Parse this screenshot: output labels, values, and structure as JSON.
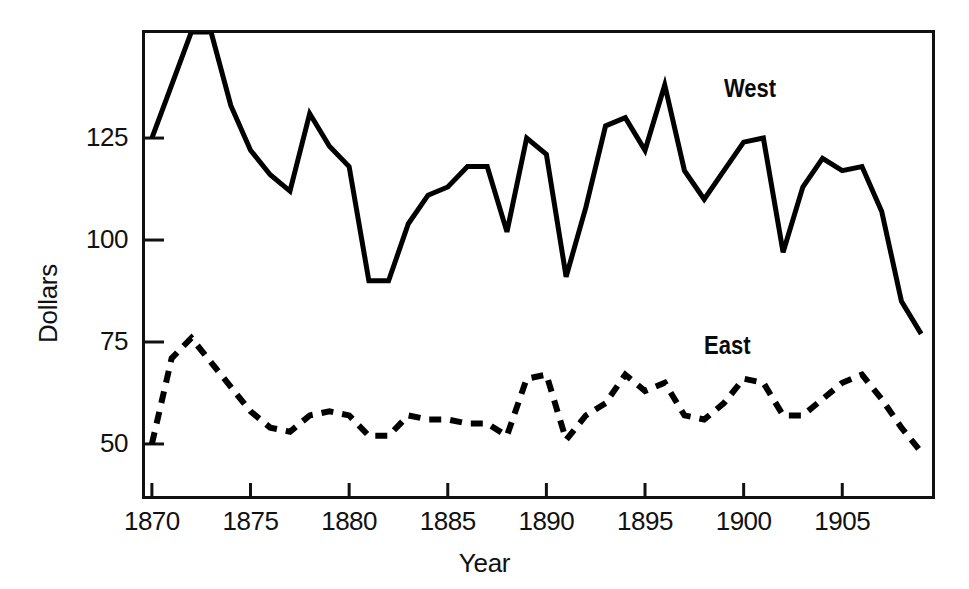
{
  "chart_data": {
    "type": "line",
    "title": "",
    "xlabel": "Year",
    "ylabel": "Dollars",
    "xlim": [
      1869.6,
      1909.6
    ],
    "ylim": [
      37,
      151
    ],
    "grid": false,
    "legend_position": "inline-annotations",
    "xticks": [
      1870,
      1875,
      1880,
      1885,
      1890,
      1895,
      1900,
      1905
    ],
    "xtick_labels": [
      "1870",
      "1875",
      "1880",
      "1885",
      "1890",
      "1895",
      "1900",
      "1905"
    ],
    "yticks": [
      50,
      75,
      100,
      125
    ],
    "ytick_labels": [
      "50",
      "75",
      "100",
      "125"
    ],
    "x": [
      1870,
      1871,
      1872,
      1873,
      1874,
      1875,
      1876,
      1877,
      1878,
      1879,
      1880,
      1881,
      1882,
      1883,
      1884,
      1885,
      1886,
      1887,
      1888,
      1889,
      1890,
      1891,
      1892,
      1893,
      1894,
      1895,
      1896,
      1897,
      1898,
      1899,
      1900,
      1901,
      1902,
      1903,
      1904,
      1905,
      1906,
      1907,
      1908,
      1909
    ],
    "series": [
      {
        "name": "West",
        "style": "solid",
        "color": "#000000",
        "label_x": 1899,
        "label_y": 137,
        "values": [
          125,
          138,
          151,
          151,
          133,
          122,
          116,
          112,
          131,
          123,
          118,
          90,
          90,
          104,
          111,
          113,
          118,
          118,
          102,
          125,
          121,
          91,
          108,
          128,
          130,
          122,
          138,
          117,
          110,
          117,
          124,
          125,
          97,
          113,
          120,
          117,
          118,
          107,
          85,
          77
        ]
      },
      {
        "name": "East",
        "style": "dashed",
        "color": "#000000",
        "label_x": 1898,
        "label_y": 74,
        "values": [
          50,
          71,
          76,
          70,
          64,
          58,
          54,
          53,
          57,
          58,
          57,
          52,
          52,
          57,
          56,
          56,
          55,
          55,
          52,
          66,
          67,
          51,
          57,
          60,
          67,
          63,
          65,
          57,
          56,
          60,
          66,
          65,
          57,
          57,
          61,
          65,
          67,
          61,
          54,
          48
        ]
      }
    ]
  },
  "axis": {
    "x_title": "Year",
    "y_title": "Dollars"
  }
}
